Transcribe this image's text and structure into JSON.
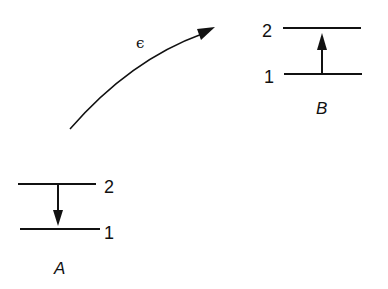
{
  "diagram": {
    "type": "energy-level-transfer",
    "colors": {
      "ink": "#111111",
      "background": "#ffffff"
    },
    "system_a": {
      "name": "A",
      "levels": [
        {
          "label": "2",
          "role": "upper"
        },
        {
          "label": "1",
          "role": "lower"
        }
      ],
      "transition": "downward (2 → 1)"
    },
    "system_b": {
      "name": "B",
      "levels": [
        {
          "label": "2",
          "role": "upper"
        },
        {
          "label": "1",
          "role": "lower"
        }
      ],
      "transition": "upward (1 → 2)"
    },
    "transfer": {
      "label": "ϵ",
      "direction": "from A to B"
    }
  }
}
